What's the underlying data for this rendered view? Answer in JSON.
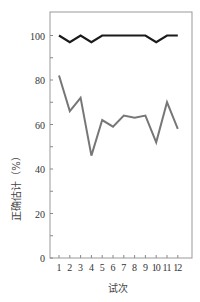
{
  "chart_data": {
    "type": "line",
    "title": "",
    "xlabel": "试次",
    "ylabel": "正确估计（%）",
    "x": [
      1,
      2,
      3,
      4,
      5,
      6,
      7,
      8,
      9,
      10,
      11,
      12
    ],
    "xticks": [
      "1",
      "2",
      "3",
      "4",
      "5",
      "6",
      "7",
      "8",
      "9",
      "10",
      "11",
      "12"
    ],
    "yticks": [
      "0",
      "20",
      "40",
      "60",
      "80",
      "100"
    ],
    "ylim": [
      0,
      110
    ],
    "grid": false,
    "legend": null,
    "series": [
      {
        "name": "upper",
        "color": "#1a1a1a",
        "values": [
          100,
          97,
          100,
          97,
          100,
          100,
          100,
          100,
          100,
          97,
          100,
          100
        ]
      },
      {
        "name": "lower",
        "color": "#777777",
        "values": [
          82,
          66,
          72,
          46,
          62,
          59,
          64,
          63,
          64,
          52,
          70,
          58
        ]
      }
    ]
  }
}
